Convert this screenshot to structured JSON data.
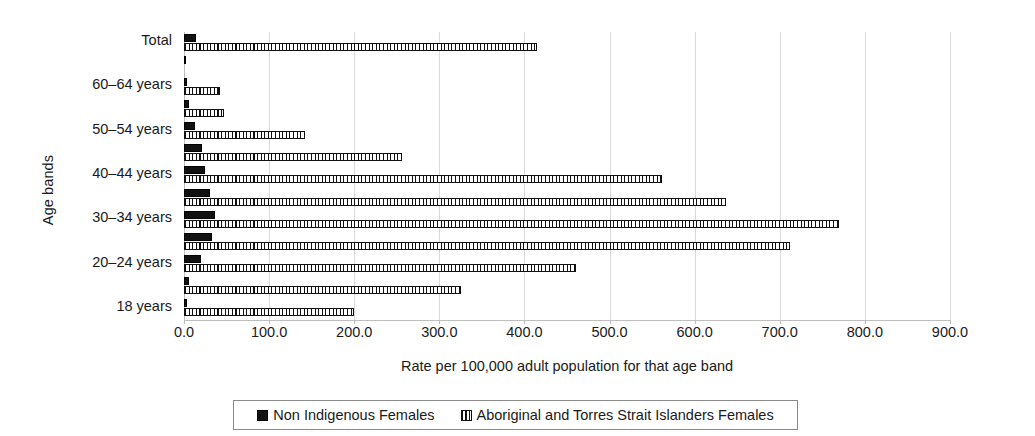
{
  "chart_data": {
    "type": "bar",
    "orientation": "horizontal",
    "title": "",
    "xlabel": "Rate per 100,000 adult population for that age band",
    "ylabel": "Age bands",
    "xlim": [
      0,
      900
    ],
    "xticks": [
      "0.0",
      "100.0",
      "200.0",
      "300.0",
      "400.0",
      "500.0",
      "600.0",
      "700.0",
      "800.0",
      "900.0"
    ],
    "xtick_values": [
      0,
      100,
      200,
      300,
      400,
      500,
      600,
      700,
      800,
      900
    ],
    "grid": true,
    "legend_position": "bottom",
    "categories": [
      "Total",
      "65+ years",
      "60–64 years",
      "55–59 years",
      "50–54 years",
      "45–49 years",
      "40–44 years",
      "35–39 years",
      "30–34 years",
      "25–29 years",
      "20–24 years",
      "19 years",
      "18 years"
    ],
    "visible_category_labels": [
      "Total",
      "",
      "60–64 years",
      "",
      "50–54 years",
      "",
      "40–44 years",
      "",
      "30–34 years",
      "",
      "20–24 years",
      "",
      "18 years"
    ],
    "series": [
      {
        "name": "Non Indigenous Females",
        "pattern": "solid",
        "color": "#111111",
        "values": [
          14,
          1,
          3,
          6,
          13,
          21,
          25,
          31,
          36,
          33,
          20,
          6,
          3
        ]
      },
      {
        "name": "Aboriginal and Torres Strait Islanders Females",
        "pattern": "hatched",
        "color": "#111111",
        "values": [
          415,
          0,
          42,
          47,
          142,
          256,
          562,
          637,
          770,
          712,
          460,
          325,
          200
        ]
      }
    ]
  },
  "legend": {
    "items": [
      {
        "label": "Non Indigenous Females",
        "pattern": "solid"
      },
      {
        "label": "Aboriginal and Torres Strait Islanders Females",
        "pattern": "hatched"
      }
    ]
  }
}
